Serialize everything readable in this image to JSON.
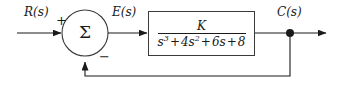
{
  "diagram": {
    "type": "control-system-block-diagram",
    "line_color": "#1a1a1a",
    "block_border_color": "#3a3a3a",
    "background": "#ffffff"
  },
  "signals": {
    "input_label": "R(s)",
    "error_label": "E(s)",
    "output_label": "C(s)"
  },
  "summing_junction": {
    "glyph": "Σ",
    "name": "summing-junction",
    "input_sign": "+",
    "feedback_sign": "−",
    "center_x": 85,
    "center_y": 33,
    "radius": 23
  },
  "plant_block": {
    "name": "transfer-function-block",
    "numerator": "K",
    "denominator_terms": [
      {
        "coefficient": "s",
        "exponent": "3"
      },
      {
        "operator": "+",
        "coefficient": "4",
        "variable": "s",
        "exponent": "2"
      },
      {
        "operator": "+",
        "coefficient": "6",
        "variable": "s",
        "exponent": ""
      },
      {
        "operator": "+",
        "coefficient": "8",
        "variable": "",
        "exponent": ""
      }
    ],
    "denominator_text": "s3 + 4s2 + 6s + 8",
    "transfer_function": "K / (s^3 + 4s^2 + 6s + 8)"
  },
  "feedback": {
    "path_type": "unity",
    "takeoff_node_x": 290,
    "takeoff_node_y": 33,
    "return_y": 76
  }
}
